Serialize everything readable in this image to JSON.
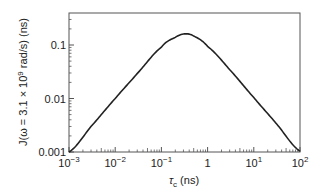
{
  "chart_data": {
    "type": "line",
    "title": "",
    "xlabel": "τc (ns)",
    "xlabel_parts": {
      "symbol": "τ",
      "sub": "c",
      "unit": " (ns)"
    },
    "ylabel": "J(ω = 3.1 × 10^9 rad/s) (ns)",
    "ylabel_parts": {
      "prefix": "J(ω = 3.1 × 10",
      "sup": "9",
      "suffix": " rad/s) (ns)"
    },
    "xscale": "log",
    "yscale": "log",
    "xlim": [
      0.001,
      100
    ],
    "ylim": [
      0.001,
      0.25
    ],
    "grid": false,
    "legend": null,
    "x_ticks": [
      {
        "value": 0.001,
        "base": "10",
        "exp": "−3"
      },
      {
        "value": 0.01,
        "base": "10",
        "exp": "−2"
      },
      {
        "value": 0.1,
        "base": "10",
        "exp": "−1"
      },
      {
        "value": 1,
        "base": "1",
        "exp": ""
      },
      {
        "value": 10,
        "base": "10",
        "exp": "1"
      },
      {
        "value": 100,
        "base": "10",
        "exp": "2"
      }
    ],
    "y_ticks": [
      {
        "value": 0.001,
        "label": "0.001"
      },
      {
        "value": 0.01,
        "label": "0.01"
      },
      {
        "value": 0.1,
        "label": "0.1"
      }
    ],
    "series": [
      {
        "name": "J(τc) = τc / (1 + ω²τc²), ω = 3.1 ns⁻¹",
        "color": "#222222",
        "x": [
          0.001,
          0.003,
          0.01,
          0.03,
          0.1,
          0.2,
          0.32,
          0.5,
          1,
          3,
          10,
          30,
          100
        ],
        "values": [
          0.001,
          0.003,
          0.00999,
          0.0293,
          0.0912,
          0.1388,
          0.1613,
          0.1468,
          0.0942,
          0.0346,
          0.0104,
          0.00347,
          0.00104
        ]
      }
    ],
    "peak": {
      "x": 0.32,
      "y": 0.161
    }
  }
}
